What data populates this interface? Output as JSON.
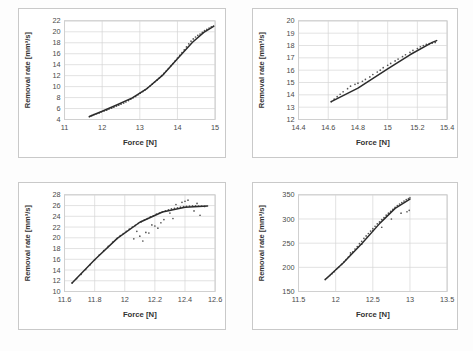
{
  "figure": {
    "name": "four-panel-removal-rate-vs-force",
    "panel_count": 4,
    "background_color": "#fdfdfd",
    "panel_border_color": "#c9c9c9"
  },
  "common": {
    "xlabel": "Force [N]",
    "ylabel": "Removal rate [mm³/s]",
    "curve_color": "#2b2b2b",
    "point_color": "#555555",
    "grid_color": "#d5d5d5"
  },
  "chart_data": [
    {
      "id": "panel-top-left",
      "type": "scatter",
      "title": "",
      "xlabel": "Force [N]",
      "ylabel": "Removal rate [mm³/s]",
      "xlim": [
        11,
        15
      ],
      "ylim": [
        4,
        22
      ],
      "xticks": [
        11,
        12,
        13,
        14,
        15
      ],
      "xtick_labels": [
        "11",
        "12",
        "13",
        "14",
        "15"
      ],
      "yticks": [
        4,
        6,
        8,
        10,
        12,
        14,
        16,
        18,
        20,
        22
      ],
      "ytick_labels": [
        "4",
        "6",
        "8",
        "10",
        "12",
        "14",
        "16",
        "18",
        "20",
        "22"
      ],
      "grid": true,
      "legend": "none",
      "series": [
        {
          "name": "measured",
          "kind": "scatter",
          "x": [
            11.66,
            11.72,
            11.78,
            11.85,
            11.92,
            11.98,
            12.05,
            12.12,
            12.18,
            12.25,
            12.31,
            12.38,
            12.44,
            12.5,
            12.57,
            12.63,
            12.7,
            12.76,
            12.82,
            12.89,
            12.95,
            13.01,
            13.08,
            13.14,
            13.2,
            13.27,
            13.33,
            13.39,
            13.46,
            13.52,
            13.58,
            13.64,
            13.7,
            13.76,
            13.82,
            13.88,
            13.94,
            14.0,
            14.06,
            14.12,
            14.18,
            14.24,
            14.3,
            14.36,
            14.42,
            14.48,
            14.54,
            14.6,
            14.66,
            14.72,
            14.78,
            14.84,
            14.9,
            14.96
          ],
          "y": [
            4.5,
            4.7,
            4.9,
            5.05,
            5.2,
            5.4,
            5.55,
            5.7,
            5.9,
            6.05,
            6.25,
            6.45,
            6.6,
            6.8,
            7.0,
            7.2,
            7.45,
            7.7,
            7.95,
            8.2,
            8.5,
            8.8,
            9.1,
            9.4,
            9.75,
            10.1,
            10.45,
            10.8,
            11.2,
            11.6,
            12.0,
            12.4,
            12.85,
            13.3,
            13.75,
            14.2,
            14.7,
            15.2,
            15.7,
            16.2,
            16.7,
            17.25,
            17.8,
            18.3,
            18.7,
            19.05,
            19.35,
            19.6,
            19.9,
            20.2,
            20.45,
            20.7,
            20.9,
            21.05
          ]
        },
        {
          "name": "fit",
          "kind": "line",
          "x": [
            11.66,
            12.0,
            12.4,
            12.8,
            13.2,
            13.6,
            14.0,
            14.4,
            14.7,
            14.96
          ],
          "y": [
            4.55,
            5.5,
            6.7,
            7.95,
            9.7,
            12.05,
            15.1,
            18.1,
            19.9,
            21.0
          ]
        }
      ]
    },
    {
      "id": "panel-top-right",
      "type": "scatter",
      "title": "",
      "xlabel": "Force [N]",
      "ylabel": "Removal rate [mm³/s]",
      "xlim": [
        14.4,
        15.4
      ],
      "ylim": [
        12,
        20
      ],
      "xticks": [
        14.4,
        14.6,
        14.8,
        15.0,
        15.2,
        15.4
      ],
      "xtick_labels": [
        "14.4",
        "14.6",
        "14.8",
        "15",
        "15.2",
        "15.4"
      ],
      "yticks": [
        12,
        13,
        14,
        15,
        16,
        17,
        18,
        19,
        20
      ],
      "ytick_labels": [
        "12",
        "13",
        "14",
        "15",
        "16",
        "17",
        "18",
        "19",
        "20"
      ],
      "grid": true,
      "legend": "none",
      "series": [
        {
          "name": "measured",
          "kind": "scatter",
          "x": [
            14.62,
            14.64,
            14.66,
            14.68,
            14.7,
            14.73,
            14.75,
            14.78,
            14.8,
            14.83,
            14.85,
            14.88,
            14.9,
            14.93,
            14.95,
            14.97,
            15.0,
            15.02,
            15.05,
            15.07,
            15.1,
            15.12,
            15.15,
            15.17,
            15.2,
            15.22,
            15.24,
            15.26,
            15.28,
            15.3,
            15.32
          ],
          "y": [
            13.45,
            13.65,
            13.85,
            14.05,
            14.25,
            14.5,
            14.7,
            14.85,
            14.95,
            15.1,
            15.25,
            15.45,
            15.65,
            15.85,
            16.0,
            16.2,
            16.4,
            16.55,
            16.75,
            16.9,
            17.1,
            17.25,
            17.45,
            17.6,
            17.75,
            17.9,
            18.0,
            18.1,
            18.15,
            18.2,
            18.25
          ]
        },
        {
          "name": "fit",
          "kind": "line",
          "x": [
            14.62,
            14.8,
            15.0,
            15.15,
            15.3,
            15.33
          ],
          "y": [
            13.45,
            14.55,
            16.1,
            17.25,
            18.25,
            18.4
          ]
        }
      ]
    },
    {
      "id": "panel-bottom-left",
      "type": "scatter",
      "title": "",
      "xlabel": "Force [N]",
      "ylabel": "Removal rate [mm³/s]",
      "xlim": [
        11.6,
        12.6
      ],
      "ylim": [
        10,
        28
      ],
      "xticks": [
        11.6,
        11.8,
        12.0,
        12.2,
        12.4,
        12.6
      ],
      "xtick_labels": [
        "11.6",
        "11.8",
        "12",
        "12.2",
        "12.4",
        "12.6"
      ],
      "yticks": [
        10,
        12,
        14,
        16,
        18,
        20,
        22,
        24,
        26,
        28
      ],
      "ytick_labels": [
        "10",
        "12",
        "14",
        "16",
        "18",
        "20",
        "22",
        "24",
        "26",
        "28"
      ],
      "grid": true,
      "legend": "none",
      "series": [
        {
          "name": "measured",
          "kind": "scatter",
          "x": [
            11.65,
            11.68,
            11.71,
            11.74,
            11.77,
            11.8,
            11.83,
            11.86,
            11.89,
            11.92,
            11.95,
            11.97,
            11.99,
            12.01,
            12.03,
            12.05,
            12.07,
            12.09,
            12.11,
            12.13,
            12.15,
            12.17,
            12.19,
            12.21,
            12.23,
            12.25,
            12.27,
            12.29,
            12.31,
            12.33,
            12.35,
            12.37,
            12.39,
            12.41,
            12.43,
            12.45,
            12.47,
            12.49,
            12.51,
            12.53,
            12.06,
            12.1,
            12.14,
            12.18,
            12.22,
            12.26,
            12.3,
            12.34,
            12.38,
            12.42,
            12.46,
            12.5,
            12.08,
            12.16,
            12.24,
            12.32,
            12.4,
            12.48,
            12.12,
            12.2
          ],
          "y": [
            11.6,
            12.4,
            13.2,
            14.1,
            15.0,
            15.9,
            16.8,
            17.6,
            18.4,
            19.2,
            19.9,
            20.4,
            20.8,
            21.2,
            21.6,
            22.0,
            22.3,
            22.7,
            23.0,
            23.3,
            23.6,
            23.9,
            24.1,
            24.4,
            24.6,
            24.8,
            25.0,
            25.2,
            25.4,
            25.5,
            25.6,
            25.7,
            25.8,
            25.85,
            25.9,
            25.95,
            25.95,
            25.9,
            25.9,
            25.85,
            19.8,
            20.3,
            21.0,
            22.4,
            21.8,
            23.4,
            24.6,
            26.2,
            26.6,
            27.0,
            25.0,
            24.2,
            21.2,
            20.9,
            22.8,
            23.6,
            26.8,
            26.4,
            19.4,
            22.2
          ]
        },
        {
          "name": "fit",
          "kind": "line",
          "x": [
            11.65,
            11.8,
            11.95,
            12.1,
            12.25,
            12.4,
            12.55
          ],
          "y": [
            11.6,
            15.9,
            19.9,
            22.9,
            24.8,
            25.7,
            25.9
          ]
        }
      ]
    },
    {
      "id": "panel-bottom-right",
      "type": "scatter",
      "title": "",
      "xlabel": "Force [N]",
      "ylabel": "Removal rate [mm³/s]",
      "xlim": [
        11.5,
        13.5
      ],
      "ylim": [
        150,
        350
      ],
      "xticks": [
        11.5,
        12.0,
        12.5,
        13.0,
        13.5
      ],
      "xtick_labels": [
        "11.5",
        "12",
        "12.5",
        "13",
        "13.5"
      ],
      "yticks": [
        150,
        200,
        250,
        300,
        350
      ],
      "ytick_labels": [
        "150",
        "200",
        "250",
        "300",
        "350"
      ],
      "grid": true,
      "legend": "none",
      "series": [
        {
          "name": "measured",
          "kind": "scatter",
          "x": [
            11.86,
            11.89,
            11.92,
            11.95,
            11.98,
            12.01,
            12.04,
            12.08,
            12.11,
            12.14,
            12.17,
            12.2,
            12.23,
            12.26,
            12.29,
            12.32,
            12.35,
            12.38,
            12.41,
            12.44,
            12.47,
            12.5,
            12.53,
            12.56,
            12.59,
            12.62,
            12.65,
            12.68,
            12.71,
            12.74,
            12.77,
            12.8,
            12.83,
            12.86,
            12.89,
            12.92,
            12.95,
            12.98,
            13.0,
            12.2,
            12.35,
            12.5,
            12.62,
            12.75,
            12.88,
            12.96,
            12.99
          ],
          "y": [
            175,
            179,
            183,
            187,
            191,
            196,
            200,
            206,
            211,
            216,
            221,
            227,
            232,
            238,
            243,
            249,
            254,
            260,
            265,
            270,
            275,
            280,
            285,
            290,
            294,
            299,
            303,
            308,
            312,
            316,
            320,
            324,
            328,
            331,
            334,
            337,
            340,
            342,
            344,
            230,
            248,
            276,
            283,
            300,
            312,
            315,
            318
          ]
        },
        {
          "name": "fit",
          "kind": "line",
          "x": [
            11.86,
            12.1,
            12.35,
            12.6,
            12.8,
            13.0
          ],
          "y": [
            175,
            209,
            249,
            292,
            322,
            341
          ]
        }
      ]
    }
  ]
}
